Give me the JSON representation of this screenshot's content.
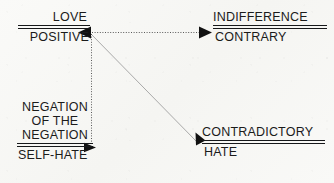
{
  "diagram": {
    "background_color": "#f8f8f6",
    "text_color": "#1b1b1b",
    "blocks": [
      {
        "id": "love",
        "position": "top-left",
        "numerator": "LOVE",
        "denominator": "POSITIVE"
      },
      {
        "id": "indifference",
        "position": "top-right",
        "numerator": "INDIFFERENCE",
        "denominator": "CONTRARY"
      },
      {
        "id": "negation",
        "position": "bottom-left",
        "numerator_line_1": "NEGATION",
        "numerator_line_2": "OF THE",
        "numerator_line_3": "NEGATION",
        "denominator": "SELF-HATE"
      },
      {
        "id": "contradictory",
        "position": "bottom-right",
        "numerator": "CONTRADICTORY",
        "denominator": "HATE"
      }
    ],
    "connectors": [
      {
        "id": "horizontal-contrary-axis",
        "style": "dotted",
        "color": "#5a5a5a",
        "from": "love",
        "to": "indifference",
        "arrowheads": "both"
      },
      {
        "id": "vertical-negation-axis",
        "style": "dotted",
        "color": "#5a5a5a",
        "from": "love",
        "to": "negation",
        "arrowheads": "end"
      },
      {
        "id": "diagonal-contradiction-axis",
        "style": "solid",
        "color": "#9a9a9a",
        "from": "love",
        "to": "contradictory",
        "arrowheads": "end"
      }
    ]
  }
}
